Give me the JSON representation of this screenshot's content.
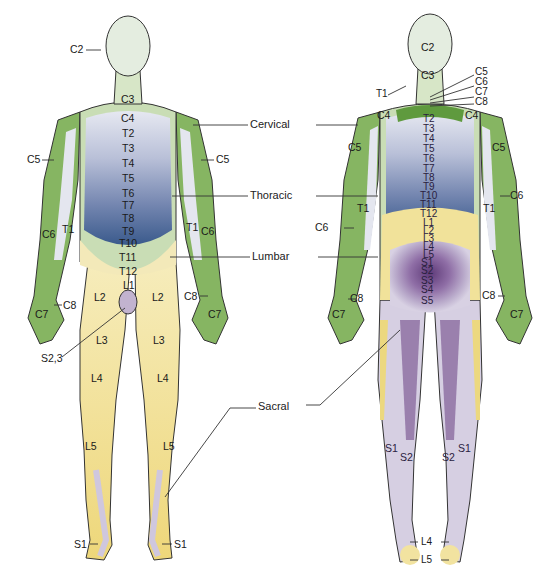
{
  "figure": {
    "views": [
      "anterior",
      "posterior"
    ]
  },
  "colors": {
    "cervical": "#7fae5a",
    "cervical_light": "#c9ddb5",
    "head": "#e3ecdc",
    "thoracic_top": "#e4e6f0",
    "thoracic_bottom": "#3c5d8f",
    "lumbar": "#f0df8c",
    "lumbar_light": "#f7eec4",
    "sacral_light": "#d7d0e2",
    "sacral_dark": "#6f4a86",
    "outline": "#333333"
  },
  "regions": {
    "cervical": "Cervical",
    "thoracic": "Thoracic",
    "lumbar": "Lumbar",
    "sacral": "Sacral"
  },
  "anterior": {
    "labels": {
      "c2": "C2",
      "c3": "C3",
      "c4": "C4",
      "c5_left": "C5",
      "c5_right": "C5",
      "t2": "T2",
      "t3": "T3",
      "t4": "T4",
      "t5": "T5",
      "t6": "T6",
      "t7": "T7",
      "t8": "T8",
      "t9": "T9",
      "t10": "T10",
      "t11": "T11",
      "t12": "T12",
      "c6_left": "C6",
      "t1_left": "T1",
      "t1_right": "T1",
      "c6_right": "C6",
      "c8_left": "C8",
      "c8_right": "C8",
      "c7_left": "C7",
      "c7_right": "C7",
      "l1": "L1",
      "l2_left": "L2",
      "l2_right": "L2",
      "l3_left": "L3",
      "l3_right": "L3",
      "s23": "S2,3",
      "l4_left": "L4",
      "l4_right": "L4",
      "l5_left": "L5",
      "l5_right": "L5",
      "s1_left": "S1",
      "s1_right": "S1"
    }
  },
  "posterior": {
    "labels": {
      "c2": "C2",
      "c3": "C3",
      "c5_top": "C5",
      "c6_top": "C6",
      "c7_top": "C7",
      "c8_top": "C8",
      "t1_top": "T1",
      "c4_left": "C4",
      "c4_right": "C4",
      "c5_left": "C5",
      "c5_right": "C5",
      "t2": "T2",
      "t3": "T3",
      "t4": "T4",
      "t5": "T5",
      "t6": "T6",
      "t7": "T7",
      "t8": "T8",
      "t9": "T9",
      "t10": "T10",
      "t11": "T11",
      "t12": "T12",
      "l1": "L1",
      "l2": "L2",
      "l3": "L3",
      "l4": "L4",
      "l5": "L5",
      "s1": "S1",
      "s2": "S2",
      "s3": "S3",
      "s4": "S4",
      "s5": "S5",
      "c6_left": "C6",
      "c6_right": "C6",
      "t1_left": "T1",
      "t1_right": "T1",
      "c8_left": "C8",
      "c8_right": "C8",
      "c7_left": "C7",
      "c7_right": "C7",
      "s1_left": "S1",
      "s2_left": "S2",
      "s2_right": "S2",
      "s1_right": "S1",
      "l4_foot": "L4",
      "l5_foot": "L5"
    }
  }
}
